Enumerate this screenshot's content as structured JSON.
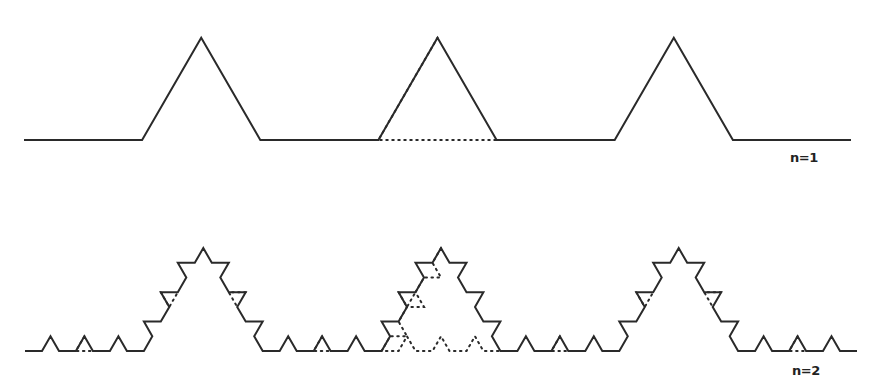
{
  "figure": {
    "stroke_color": "#2a2a2a",
    "background": "#ffffff",
    "generator_unit_directions_deg": [
      0,
      60,
      -60,
      0,
      60,
      -60,
      0,
      60,
      -60,
      0
    ],
    "panels": [
      {
        "id": "n1",
        "label": "n=1",
        "iteration": 1,
        "start": [
          24,
          140
        ],
        "end": [
          851,
          140
        ],
        "dotted_segment_index": 5
      },
      {
        "id": "n2",
        "label": "n=2",
        "iteration": 2,
        "start": [
          25,
          351
        ],
        "end": [
          857,
          351
        ],
        "dotted_segment_index": 5
      }
    ]
  }
}
